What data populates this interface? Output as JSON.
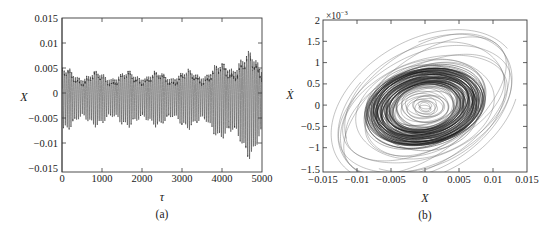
{
  "figure": {
    "background_color": "#ffffff",
    "line_color": "#2b2b2b",
    "axis_color": "#3a3a3a"
  },
  "panels": [
    {
      "id": "a",
      "caption": "(a)",
      "xlabel": "τ",
      "ylabel": "X",
      "exponent_label": "",
      "xticks": [
        "0",
        "1000",
        "2000",
        "3000",
        "4000",
        "5000"
      ],
      "yticks": [
        "0.015",
        "0.01",
        "0.005",
        "0",
        "−0.005",
        "−0.01",
        "−0.015"
      ]
    },
    {
      "id": "b",
      "caption": "(b)",
      "xlabel": "X",
      "ylabel": "Ẋ",
      "exponent_base": "×10",
      "exponent_power": "−3",
      "xticks": [
        "−0.015",
        "−0.01",
        "−0.005",
        "0",
        "0.005",
        "0.01",
        "0.015"
      ],
      "yticks": [
        "2",
        "1.5",
        "1",
        "0.5",
        "0",
        "−0.5",
        "−1",
        "−1.5"
      ]
    }
  ],
  "chart_data": [
    {
      "type": "line",
      "panel": "a",
      "title": "",
      "xlabel": "τ",
      "ylabel": "X",
      "xlim": [
        0,
        5000
      ],
      "ylim": [
        -0.015,
        0.015
      ],
      "xticks": [
        0,
        1000,
        2000,
        3000,
        4000,
        5000
      ],
      "yticks": [
        -0.015,
        -0.01,
        -0.005,
        0,
        0.005,
        0.01,
        0.015
      ],
      "grid": false,
      "legend": "none",
      "description": "Self-excited oscillation time history: dense high-frequency oscillation whose envelope stays near ±0.0075 until τ≈3500 then grows rapidly, reaching about ±0.013 near τ≈4800.",
      "envelope": {
        "tau": [
          0,
          250,
          500,
          750,
          1000,
          1250,
          1500,
          1750,
          2000,
          2250,
          2500,
          2750,
          3000,
          3250,
          3500,
          3750,
          4000,
          4250,
          4500,
          4750,
          5000
        ],
        "upper": [
          0.008,
          0.0072,
          0.0068,
          0.0067,
          0.0066,
          0.0066,
          0.0067,
          0.0068,
          0.007,
          0.0068,
          0.0066,
          0.0068,
          0.0072,
          0.0072,
          0.0074,
          0.0082,
          0.0094,
          0.0106,
          0.0118,
          0.0126,
          0.0108
        ],
        "lower": [
          -0.0079,
          -0.0072,
          -0.0068,
          -0.0067,
          -0.0066,
          -0.0066,
          -0.0067,
          -0.0068,
          -0.007,
          -0.0068,
          -0.0066,
          -0.0068,
          -0.0072,
          -0.0072,
          -0.0074,
          -0.0084,
          -0.0096,
          -0.0108,
          -0.0122,
          -0.0138,
          -0.0112
        ]
      },
      "oscillation_period_tau": 47,
      "cycles_visible": 106
    },
    {
      "type": "line",
      "panel": "b",
      "title": "",
      "xlabel": "X",
      "ylabel": "Ẋ",
      "xlim": [
        -0.015,
        0.015
      ],
      "ylim": [
        -0.0015,
        0.002
      ],
      "y_scale_factor": 0.001,
      "xticks": [
        -0.015,
        -0.01,
        -0.005,
        0,
        0.005,
        0.01,
        0.015
      ],
      "yticks": [
        -0.0015,
        -0.001,
        -0.0005,
        0,
        0.0005,
        0.001,
        0.0015,
        0.002
      ],
      "grid": false,
      "legend": "none",
      "description": "Phase portrait (X vs X-dot): trajectory spirals outward from near the origin, densely filling an elliptical annulus between radii ~0.003 and ~0.008 in X, with a few larger outer excursion loops extending to X≈±0.013 and Ẋ≈±0.0014.",
      "rings": {
        "inner_radii_x": [
          0.0008,
          0.0016,
          0.0024,
          0.0032,
          0.004
        ],
        "dense_band_x": [
          0.0052,
          0.006,
          0.0068,
          0.0076,
          0.0082
        ],
        "outer_radii_x": [
          0.0095,
          0.0108,
          0.012,
          0.0132
        ],
        "aspect_ratio_ydot_per_x": 0.105
      },
      "center": [
        0.0,
        0.0
      ]
    }
  ]
}
